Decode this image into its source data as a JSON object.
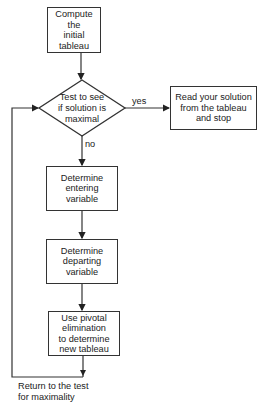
{
  "nodes": {
    "start": {
      "lines": [
        "Compute",
        "the",
        "initial",
        "tableau"
      ]
    },
    "decision": {
      "lines": [
        "Test to see",
        "if solution is",
        "maximal"
      ]
    },
    "stop": {
      "lines": [
        "Read your solution",
        "from the tableau",
        "and stop"
      ]
    },
    "entering": {
      "lines": [
        "Determine",
        "entering",
        "variable"
      ]
    },
    "departing": {
      "lines": [
        "Determine",
        "departing",
        "variable"
      ]
    },
    "pivot": {
      "lines": [
        "Use pivotal",
        "elimination",
        "to determine",
        "new tableau"
      ]
    }
  },
  "edges": {
    "yes_label": "yes",
    "no_label": "no"
  },
  "loop": {
    "lines": [
      "Return to the test",
      "for maximality"
    ]
  }
}
